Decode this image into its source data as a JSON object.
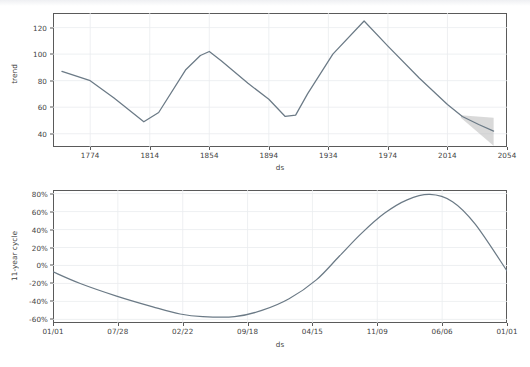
{
  "figure": {
    "background_color": "#ffffff",
    "line_color": "#6b7a86",
    "uncertainty_color": "#b9b9b9",
    "frame_color": "#5a5a5a",
    "grid_color": "#eaecef",
    "text_color": "#3f3f3f"
  },
  "chart_data": [
    {
      "type": "line",
      "name": "trend",
      "title": "",
      "xlabel": "ds",
      "ylabel": "trend",
      "grid": true,
      "legend": "none",
      "xtick_labels": [
        "1774",
        "1814",
        "1854",
        "1894",
        "1934",
        "1974",
        "2014",
        "2054"
      ],
      "xtick_values": [
        1774,
        1814,
        1854,
        1894,
        1934,
        1974,
        2014,
        2054
      ],
      "ytick_labels": [
        "40",
        "60",
        "80",
        "100",
        "120"
      ],
      "ytick_values": [
        40,
        60,
        80,
        100,
        120
      ],
      "xlim": [
        1749,
        2054
      ],
      "ylim": [
        30,
        131
      ],
      "x": [
        1755,
        1774,
        1790,
        1810,
        1820,
        1838,
        1848,
        1854,
        1862,
        1880,
        1894,
        1905,
        1912,
        1920,
        1937,
        1958,
        1974,
        1995,
        2014,
        2024,
        2035,
        2045
      ],
      "y": [
        87,
        80,
        67,
        49,
        56,
        88,
        99,
        102,
        95,
        78,
        66,
        53,
        54,
        70,
        100,
        125,
        106,
        82,
        62,
        53,
        47,
        42
      ],
      "uncertainty": {
        "start_x": 2023,
        "end_x": 2045,
        "lower": [
          52,
          31
        ],
        "upper": [
          54,
          52
        ],
        "label": "uncertainty interval"
      }
    },
    {
      "type": "line",
      "name": "11-year cycle",
      "title": "",
      "xlabel": "ds",
      "ylabel": "11-year cycle",
      "grid": true,
      "legend": "none",
      "xtick_labels": [
        "01/01",
        "07/28",
        "02/22",
        "09/18",
        "04/15",
        "11/09",
        "06/06",
        "01/01"
      ],
      "ytick_labels": [
        "-60%",
        "-40%",
        "-20%",
        "0%",
        "20%",
        "40%",
        "60%",
        "80%"
      ],
      "ytick_values": [
        -60,
        -40,
        -20,
        0,
        20,
        40,
        60,
        80
      ],
      "ylim": [
        -64,
        84
      ],
      "x_fraction": [
        0.0,
        0.06,
        0.14,
        0.22,
        0.28,
        0.33,
        0.4,
        0.46,
        0.52,
        0.58,
        0.63,
        0.68,
        0.73,
        0.78,
        0.83,
        0.88,
        0.93,
        1.0
      ],
      "y": [
        -7,
        -20,
        -34,
        -46,
        -54,
        -57,
        -57,
        -50,
        -37,
        -16,
        10,
        36,
        58,
        73,
        79,
        71,
        46,
        -6
      ]
    }
  ]
}
